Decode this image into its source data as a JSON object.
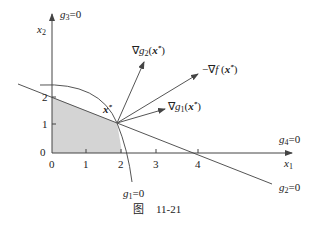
{
  "diagram": {
    "axes": {
      "x_label": "x",
      "x_label_sub": "1",
      "y_label": "x",
      "y_label_sub": "2",
      "x_ticks": [
        "0",
        "1",
        "2",
        "3",
        "4"
      ],
      "y_ticks": [
        "0",
        "1",
        "2"
      ]
    },
    "constraints": {
      "g1": "g",
      "g1_sub": "1",
      "g1_rest": "=0",
      "g2": "g",
      "g2_sub": "2",
      "g2_rest": "=0",
      "g3": "g",
      "g3_sub": "3",
      "g3_rest": "=0",
      "g4": "g",
      "g4_sub": "4",
      "g4_rest": "=0"
    },
    "point": {
      "label": "x",
      "sup": "*"
    },
    "vectors": {
      "grad_g2": "∇g",
      "grad_g2_sub": "2",
      "grad_g2_arg": "(x",
      "grad_g2_close": ")",
      "neg_grad_f": "−∇f (x",
      "neg_grad_f_close": ")",
      "grad_g1": "∇g",
      "grad_g1_sub": "1",
      "grad_g1_arg": "(x",
      "grad_g1_close": ")",
      "star": "*"
    },
    "caption": {
      "prefix": "图",
      "number": "11-21"
    },
    "colors": {
      "feasible_fill": "#d4d4d4",
      "line": "#555555"
    }
  }
}
